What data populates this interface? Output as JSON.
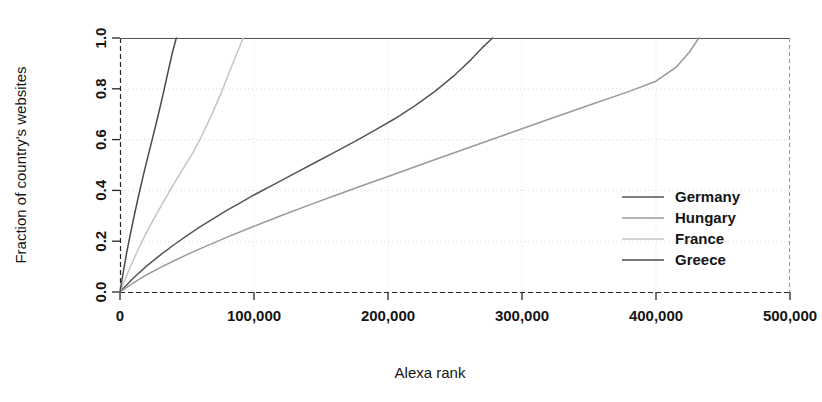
{
  "chart_data": {
    "type": "line",
    "title": "",
    "subtitle": "",
    "xlabel": "Alexa rank",
    "ylabel": "Fraction of country's websites",
    "xlim": [
      0,
      500000
    ],
    "ylim": [
      0,
      1.0
    ],
    "xticks": [
      0,
      100000,
      200000,
      300000,
      400000,
      500000
    ],
    "xtick_labels": [
      "0",
      "100,000",
      "200,000",
      "300,000",
      "400,000",
      "500,000"
    ],
    "yticks": [
      0.0,
      0.2,
      0.4,
      0.6,
      0.8,
      1.0
    ],
    "ytick_labels": [
      "0.0",
      "0.2",
      "0.4",
      "0.6",
      "0.8",
      "1.0"
    ],
    "grid": true,
    "grid_style": "dotted",
    "legend_position": "right-middle",
    "series": [
      {
        "name": "Germany",
        "color": "#555555",
        "x": [
          0,
          10000,
          20000,
          30000,
          40000,
          50000,
          60000,
          70000,
          80000,
          90000,
          100000,
          115000,
          130000,
          145000,
          160000,
          175000,
          190000,
          205000,
          220000,
          235000,
          250000,
          262000,
          270000,
          278000
        ],
        "y": [
          0.0,
          0.055,
          0.103,
          0.145,
          0.185,
          0.222,
          0.257,
          0.29,
          0.322,
          0.352,
          0.382,
          0.424,
          0.466,
          0.508,
          0.55,
          0.592,
          0.636,
          0.682,
          0.733,
          0.79,
          0.855,
          0.915,
          0.96,
          1.0
        ]
      },
      {
        "name": "Hungary",
        "color": "#9a9a9a",
        "x": [
          0,
          10000,
          20000,
          30000,
          40000,
          50000,
          60000,
          80000,
          100000,
          120000,
          140000,
          160000,
          180000,
          200000,
          230000,
          260000,
          290000,
          320000,
          350000,
          380000,
          400000,
          415000,
          425000,
          432000
        ],
        "y": [
          0.0,
          0.036,
          0.068,
          0.096,
          0.122,
          0.147,
          0.171,
          0.216,
          0.259,
          0.3,
          0.34,
          0.379,
          0.417,
          0.455,
          0.512,
          0.568,
          0.624,
          0.68,
          0.735,
          0.79,
          0.83,
          0.885,
          0.945,
          1.0
        ]
      },
      {
        "name": "France",
        "color": "#c4c4c4",
        "x": [
          0,
          5000,
          10000,
          15000,
          20000,
          27000,
          34000,
          41000,
          48000,
          55000,
          62000,
          69000,
          76000,
          83000,
          88000,
          92000
        ],
        "y": [
          0.0,
          0.066,
          0.127,
          0.184,
          0.237,
          0.305,
          0.37,
          0.433,
          0.494,
          0.554,
          0.625,
          0.705,
          0.79,
          0.885,
          0.95,
          1.0
        ]
      },
      {
        "name": "Greece",
        "color": "#4a4a4a",
        "x": [
          0,
          2500,
          5000,
          8000,
          11000,
          14000,
          17000,
          20000,
          24000,
          28000,
          32000,
          36000,
          39000,
          42000
        ],
        "y": [
          0.0,
          0.08,
          0.155,
          0.235,
          0.31,
          0.382,
          0.45,
          0.515,
          0.6,
          0.685,
          0.775,
          0.87,
          0.94,
          1.0
        ]
      }
    ]
  },
  "legend": {
    "entries": [
      {
        "label": "Germany",
        "color": "#555555"
      },
      {
        "label": "Hungary",
        "color": "#9a9a9a"
      },
      {
        "label": "France",
        "color": "#c4c4c4"
      },
      {
        "label": "Greece",
        "color": "#4a4a4a"
      }
    ]
  },
  "colors": {
    "background": "#ffffff",
    "axis": "#262626",
    "grid": "#d8d8d8",
    "text": "#151515"
  }
}
